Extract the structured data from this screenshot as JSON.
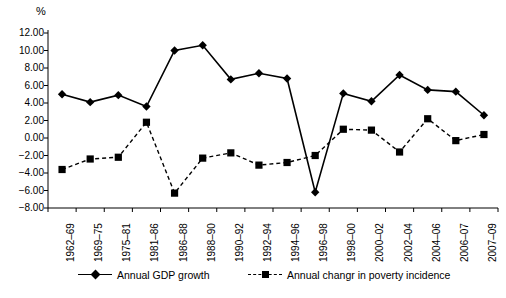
{
  "chart_data": {
    "type": "line",
    "title": "",
    "subtitle": "",
    "xlabel": "",
    "ylabel": "%",
    "ylim": [
      -8.0,
      12.0
    ],
    "ytick_step": 2.0,
    "ytick_labels": [
      "12.00",
      "10.00",
      "8.00",
      "6.00",
      "4.00",
      "2.00",
      "0.00",
      "-2.00",
      "-4.00",
      "-6.00",
      "-8.00"
    ],
    "ytick_values": [
      12.0,
      10.0,
      8.0,
      6.0,
      4.0,
      2.0,
      0.0,
      -2.0,
      -4.0,
      -6.0,
      -8.0
    ],
    "grid": false,
    "legend_position": "bottom",
    "categories": [
      "1962–69",
      "1969–75",
      "1975–81",
      "1981–86",
      "1986–88",
      "1988–90",
      "1990–92",
      "1992–94",
      "1994–96",
      "1996–98",
      "1998–00",
      "2000–02",
      "2002–04",
      "2004–06",
      "2006–07",
      "2007–09"
    ],
    "series": [
      {
        "name": "Annual GDP growth",
        "marker": "diamond",
        "line_style": "solid",
        "color": "#000000",
        "values": [
          5.0,
          4.1,
          4.9,
          3.6,
          10.0,
          10.6,
          6.7,
          7.4,
          6.8,
          -6.2,
          5.1,
          4.2,
          7.2,
          5.5,
          5.3,
          2.6
        ]
      },
      {
        "name": "Annual changr in poverty incidence",
        "marker": "square",
        "line_style": "dashed",
        "color": "#000000",
        "values": [
          -3.6,
          -2.4,
          -2.2,
          1.8,
          -6.3,
          -2.3,
          -1.7,
          -3.1,
          -2.8,
          -2.0,
          1.0,
          0.9,
          -1.6,
          2.2,
          -0.3,
          0.4
        ]
      }
    ]
  },
  "legend": {
    "entries": [
      {
        "label": "Annual GDP growth"
      },
      {
        "label": "Annual changr in poverty incidence"
      }
    ]
  }
}
